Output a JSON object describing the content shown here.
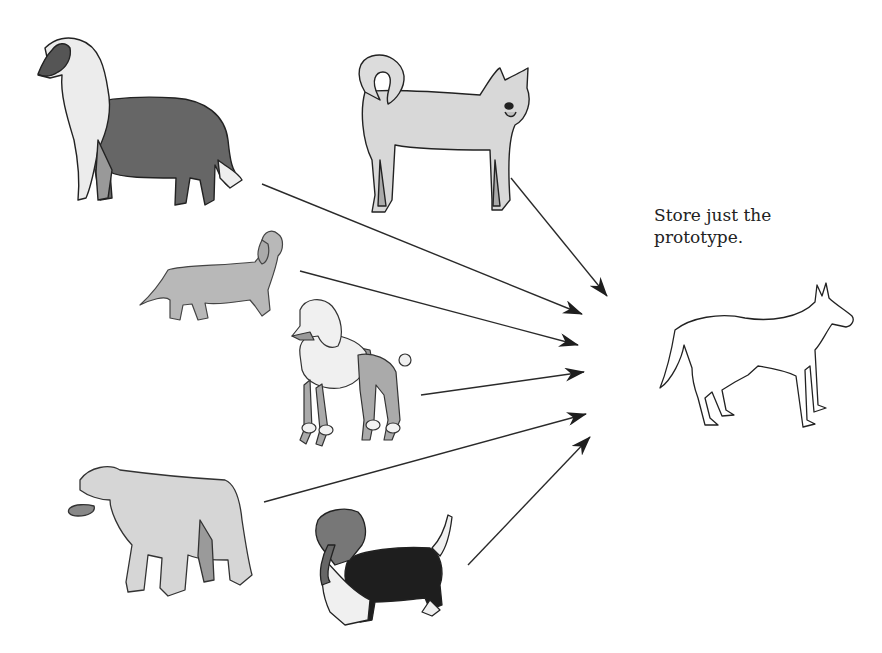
{
  "figure": {
    "caption_lines": [
      "Store just the",
      "prototype."
    ],
    "colors": {
      "background": "#ffffff",
      "outline": "#222222",
      "light_fill": "#d8d8d8",
      "mid_fill": "#a9a9a9",
      "dark_fill": "#666666",
      "black_fill": "#1e1e1e",
      "white_fill": "#f2f2f2",
      "arrow": "#2a2a2a"
    },
    "exemplars": [
      {
        "id": "collie",
        "label": "collie"
      },
      {
        "id": "husky",
        "label": "spitz / husky"
      },
      {
        "id": "dachshund",
        "label": "dachshund"
      },
      {
        "id": "poodle",
        "label": "poodle"
      },
      {
        "id": "bulldog",
        "label": "bulldog"
      },
      {
        "id": "basset",
        "label": "basset hound"
      }
    ],
    "prototype": {
      "label": "prototype dog outline"
    },
    "arrows": [
      {
        "from": "husky",
        "x1": 511,
        "y1": 178,
        "x2": 607,
        "y2": 296
      },
      {
        "from": "collie",
        "x1": 262,
        "y1": 184,
        "x2": 582,
        "y2": 314
      },
      {
        "from": "dachshund",
        "x1": 300,
        "y1": 271,
        "x2": 578,
        "y2": 345
      },
      {
        "from": "poodle",
        "x1": 421,
        "y1": 395,
        "x2": 584,
        "y2": 372
      },
      {
        "from": "bulldog",
        "x1": 264,
        "y1": 502,
        "x2": 586,
        "y2": 414
      },
      {
        "from": "basset",
        "x1": 468,
        "y1": 565,
        "x2": 590,
        "y2": 437
      }
    ]
  }
}
